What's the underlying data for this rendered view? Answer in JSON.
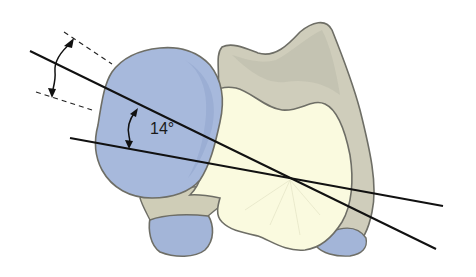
{
  "figure": {
    "angle_label": "14°"
  },
  "colors": {
    "background": "#ffffff",
    "blue_bone": "#a7b9dc",
    "blue_bone_dark": "#91a5cc",
    "gray_bone": "#cfcdbb",
    "gray_bone_shade": "#b9b8a8",
    "cream_bone": "#fafadf",
    "outline": "#6e6e66",
    "axis_line": "#111111"
  },
  "annotations": {
    "axis_lines": 2,
    "dashed_reference_lines": 2,
    "angle_arrows": 2
  }
}
